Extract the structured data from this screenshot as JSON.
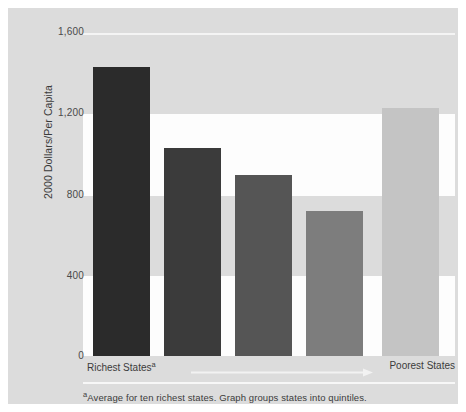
{
  "chart_data": {
    "type": "bar",
    "title": "",
    "subtitle": "",
    "xlabel": "",
    "ylabel": "2000 Dollars/Per Capita",
    "categories": [
      "Quintile 1",
      "Quintile 2",
      "Quintile 3",
      "Quintile 4",
      "Quintile 5"
    ],
    "values": [
      1430,
      1030,
      895,
      720,
      1230
    ],
    "bar_colors": [
      "#2b2b2b",
      "#3b3b3b",
      "#555555",
      "#7d7d7d",
      "#c4c4c4"
    ],
    "ylim": [
      0,
      1600
    ],
    "ytick_values": [
      0,
      400,
      800,
      1200,
      1600
    ],
    "ytick_labels": [
      "0",
      "400",
      "800",
      "1,200",
      "1,600"
    ],
    "grid": true,
    "grid_orientation": "horizontal",
    "legend": null,
    "legend_position": "none",
    "annotations": {
      "x_left_label": "Richest States",
      "x_left_superscript": "a",
      "x_right_label": "Poorest States",
      "arrow_direction": "left-to-right",
      "footnote_superscript": "a",
      "footnote": "Average for ten richest states. Graph groups states into quintiles."
    },
    "colors": {
      "plate_background": "#dcdcdc",
      "grid_band": "#fdfdfd",
      "page_background": "#ffffff",
      "text": "#3b3b3b",
      "tick_text": "#4a4a4a"
    }
  }
}
